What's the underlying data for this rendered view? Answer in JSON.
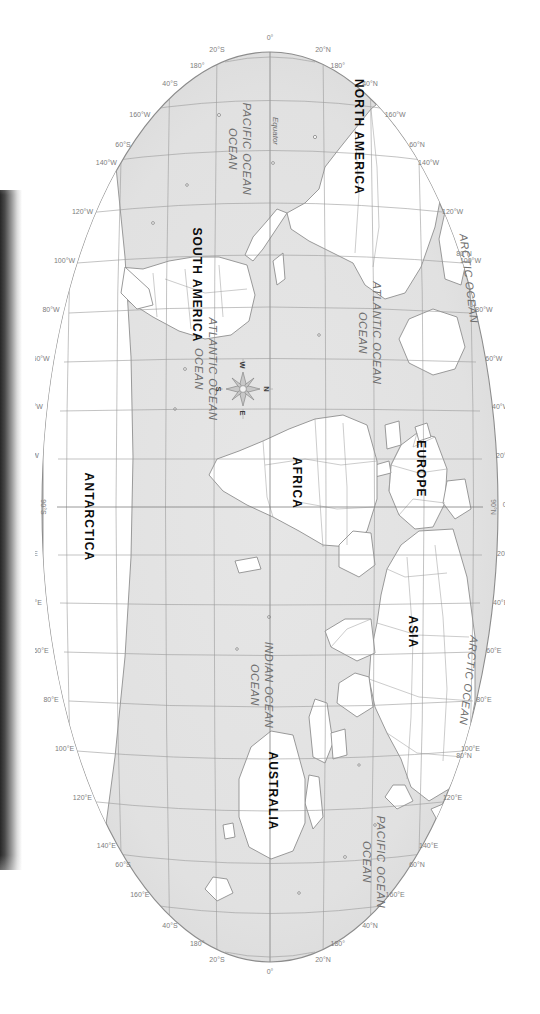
{
  "map": {
    "title": "World Map",
    "projection": "oval (Robinson-style) world projection",
    "orientation": "rotated 90 degrees clockwise (scanned book page)",
    "colors": {
      "ocean": "#e2e2e2",
      "land": "#ffffff",
      "graticule": "#9a9a9a",
      "outline": "#8c8c8c",
      "label_text": "#7d7d7d",
      "continent_text": "#111111",
      "page": "#ffffff",
      "spine_shadow": "#141414"
    },
    "continents": [
      {
        "name": "NORTH AMERICA",
        "x": 120,
        "y": 150
      },
      {
        "name": "SOUTH AMERICA",
        "x": 228,
        "y": 318
      },
      {
        "name": "EUROPE",
        "x": 452,
        "y": 97
      },
      {
        "name": "AFRICA",
        "x": 470,
        "y": 222
      },
      {
        "name": "ASIA",
        "x": 607,
        "y": 100
      },
      {
        "name": "AUSTRALIA",
        "x": 768,
        "y": 202
      },
      {
        "name": "ANTARCTICA",
        "x": 520,
        "y": 428
      }
    ],
    "oceans": [
      {
        "name": "ARCTIC OCEAN",
        "x": 262,
        "y": 40
      },
      {
        "name": "ARCTIC OCEAN",
        "x": 663,
        "y": 40
      },
      {
        "name": "PACIFIC OCEAN",
        "x": 132,
        "y": 262
      },
      {
        "name": "PACIFIC OCEAN",
        "x": 845,
        "y": 128
      },
      {
        "name": "ATLANTIC OCEAN",
        "x": 305,
        "y": 115
      },
      {
        "name": "ATLANTIC OCEAN",
        "x": 348,
        "y": 282
      },
      {
        "name": "INDIAN OCEAN",
        "x": 668,
        "y": 240
      }
    ],
    "longitude_labels_top": [
      "180°",
      "160°W",
      "140°W",
      "120°W",
      "100°W",
      "80°W",
      "60°W",
      "40°W",
      "20°W",
      "0°",
      "20°E",
      "40°E",
      "60°E",
      "80°E",
      "100°E",
      "120°E",
      "140°E",
      "160°E",
      "180°"
    ],
    "longitude_labels_bottom": [
      "180°",
      "160°W",
      "140°W",
      "120°W",
      "100°W",
      "80°W",
      "60°W",
      "40°W",
      "20°W",
      "0°",
      "20°E",
      "40°E",
      "60°E",
      "80°E",
      "100°E",
      "120°E",
      "140°E",
      "160°E",
      "180°"
    ],
    "pole_labels": {
      "north": "90°N",
      "south": "90°S"
    },
    "latitude_labels_left": [
      "80°N",
      "60°N",
      "40°N",
      "20°N",
      "0°",
      "20°S",
      "40°S",
      "60°S"
    ],
    "latitude_labels_right": [
      "80°N",
      "60°N",
      "40°N",
      "20°N",
      "0°",
      "20°S",
      "40°S",
      "60°S"
    ],
    "equator_label": "Equator",
    "compass": {
      "north": "N",
      "south": "S",
      "east": "E",
      "west": "W"
    }
  }
}
